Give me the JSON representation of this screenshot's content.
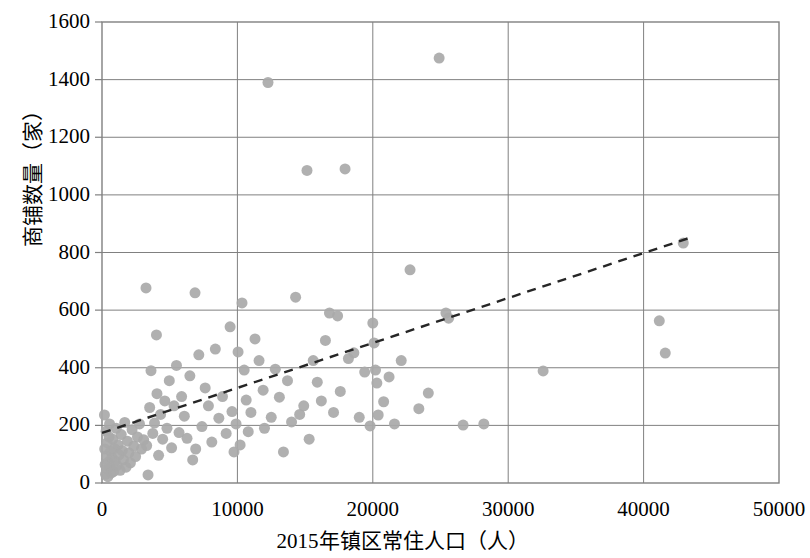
{
  "chart_data": {
    "type": "scatter",
    "title": "",
    "xlabel": "2015年镇区常住人口（人）",
    "ylabel": "商铺数量（家）",
    "xlim": [
      0,
      50000
    ],
    "ylim": [
      0,
      1600
    ],
    "xticks": [
      "0",
      "10000",
      "20000",
      "30000",
      "40000",
      "50000"
    ],
    "xtick_values": [
      0,
      10000,
      20000,
      30000,
      40000,
      50000
    ],
    "yticks": [
      "0",
      "200",
      "400",
      "600",
      "800",
      "1000",
      "1200",
      "1400",
      "1600"
    ],
    "ytick_values": [
      0,
      200,
      400,
      600,
      800,
      1000,
      1200,
      1400,
      1600
    ],
    "grid": true,
    "legend": false,
    "marker_color": "#a9a9a9",
    "marker_size": 11,
    "trendline": {
      "style": "dashed",
      "color": "#262626",
      "x": [
        0,
        43400
      ],
      "y": [
        174,
        851
      ]
    },
    "series": [
      {
        "name": "镇区商铺数量",
        "points": [
          [
            180,
            236
          ],
          [
            200,
            118
          ],
          [
            230,
            64
          ],
          [
            260,
            30
          ],
          [
            300,
            180
          ],
          [
            330,
            95
          ],
          [
            360,
            48
          ],
          [
            390,
            140
          ],
          [
            430,
            22
          ],
          [
            470,
            72
          ],
          [
            520,
            160
          ],
          [
            560,
            205
          ],
          [
            600,
            56
          ],
          [
            640,
            110
          ],
          [
            690,
            35
          ],
          [
            740,
            88
          ],
          [
            800,
            152
          ],
          [
            860,
            40
          ],
          [
            920,
            120
          ],
          [
            980,
            76
          ],
          [
            1050,
            190
          ],
          [
            1120,
            60
          ],
          [
            1190,
            132
          ],
          [
            1260,
            98
          ],
          [
            1340,
            44
          ],
          [
            1420,
            168
          ],
          [
            1500,
            112
          ],
          [
            1590,
            80
          ],
          [
            1680,
            210
          ],
          [
            1780,
            55
          ],
          [
            1880,
            145
          ],
          [
            1990,
            105
          ],
          [
            2100,
            70
          ],
          [
            2220,
            185
          ],
          [
            2350,
            128
          ],
          [
            2480,
            92
          ],
          [
            2620,
            160
          ],
          [
            2770,
            205
          ],
          [
            2920,
            118
          ],
          [
            3080,
            150
          ],
          [
            3250,
            677
          ],
          [
            3300,
            130
          ],
          [
            3400,
            28
          ],
          [
            3520,
            262
          ],
          [
            3620,
            390
          ],
          [
            3750,
            172
          ],
          [
            3880,
            208
          ],
          [
            4020,
            514
          ],
          [
            4060,
            310
          ],
          [
            4180,
            96
          ],
          [
            4330,
            238
          ],
          [
            4480,
            152
          ],
          [
            4640,
            285
          ],
          [
            4800,
            190
          ],
          [
            4970,
            355
          ],
          [
            5140,
            122
          ],
          [
            5320,
            268
          ],
          [
            5500,
            408
          ],
          [
            5690,
            175
          ],
          [
            5880,
            300
          ],
          [
            6080,
            232
          ],
          [
            6280,
            155
          ],
          [
            6490,
            372
          ],
          [
            6700,
            80
          ],
          [
            6870,
            660
          ],
          [
            6920,
            118
          ],
          [
            7150,
            445
          ],
          [
            7380,
            196
          ],
          [
            7620,
            330
          ],
          [
            7860,
            268
          ],
          [
            8110,
            142
          ],
          [
            8370,
            465
          ],
          [
            8630,
            225
          ],
          [
            8900,
            300
          ],
          [
            9170,
            172
          ],
          [
            9460,
            542
          ],
          [
            9600,
            248
          ],
          [
            9750,
            108
          ],
          [
            9900,
            205
          ],
          [
            10050,
            455
          ],
          [
            10200,
            132
          ],
          [
            10340,
            625
          ],
          [
            10500,
            392
          ],
          [
            10650,
            288
          ],
          [
            10800,
            178
          ],
          [
            11000,
            245
          ],
          [
            11300,
            500
          ],
          [
            11600,
            425
          ],
          [
            11900,
            322
          ],
          [
            12000,
            190
          ],
          [
            12260,
            1390
          ],
          [
            12500,
            228
          ],
          [
            12800,
            395
          ],
          [
            13100,
            298
          ],
          [
            13400,
            108
          ],
          [
            13700,
            355
          ],
          [
            14000,
            212
          ],
          [
            14300,
            645
          ],
          [
            14600,
            238
          ],
          [
            14900,
            268
          ],
          [
            15140,
            1085
          ],
          [
            15300,
            152
          ],
          [
            15600,
            425
          ],
          [
            15900,
            350
          ],
          [
            16200,
            285
          ],
          [
            16500,
            495
          ],
          [
            16800,
            590
          ],
          [
            17100,
            245
          ],
          [
            17400,
            580
          ],
          [
            17600,
            318
          ],
          [
            17950,
            1090
          ],
          [
            18200,
            432
          ],
          [
            18600,
            452
          ],
          [
            19000,
            228
          ],
          [
            19400,
            385
          ],
          [
            19800,
            198
          ],
          [
            20000,
            555
          ],
          [
            20100,
            486
          ],
          [
            20200,
            392
          ],
          [
            20300,
            347
          ],
          [
            20400,
            236
          ],
          [
            20800,
            282
          ],
          [
            21200,
            368
          ],
          [
            21600,
            205
          ],
          [
            22100,
            425
          ],
          [
            22750,
            740
          ],
          [
            23400,
            258
          ],
          [
            24100,
            312
          ],
          [
            24900,
            1475
          ],
          [
            25400,
            590
          ],
          [
            25600,
            572
          ],
          [
            26670,
            201
          ],
          [
            28200,
            205
          ],
          [
            32580,
            389
          ],
          [
            41160,
            563
          ],
          [
            41600,
            451
          ],
          [
            42930,
            833
          ]
        ]
      }
    ]
  },
  "axis": {
    "y_title": "商铺数量（家）",
    "x_title": "2015年镇区常住人口（人）"
  }
}
